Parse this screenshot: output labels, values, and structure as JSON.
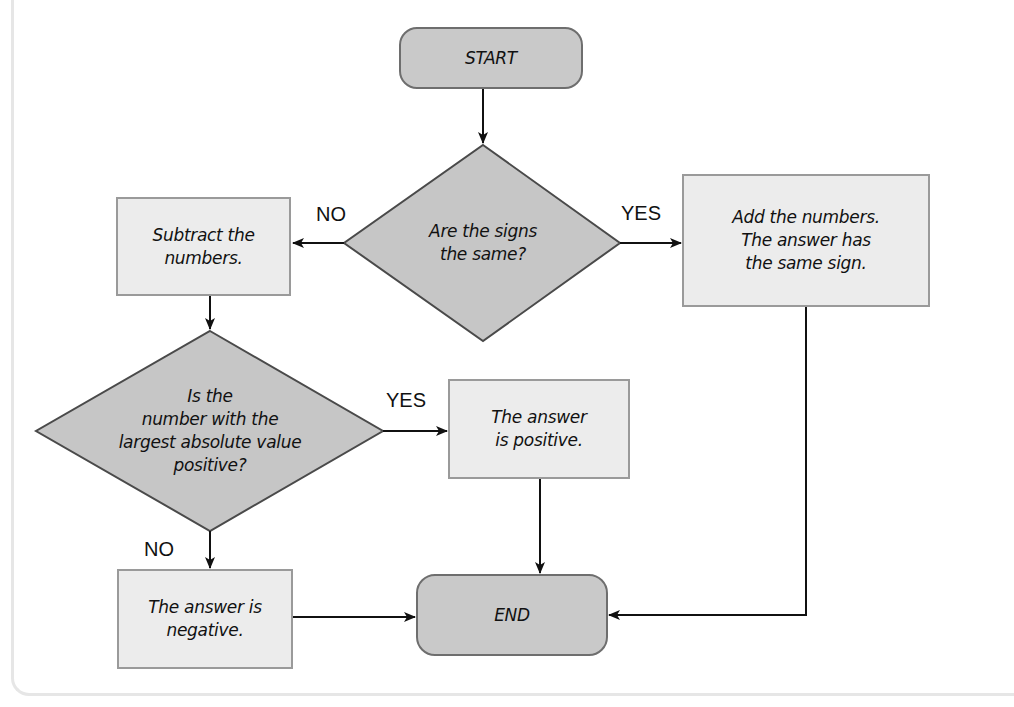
{
  "colors": {
    "box_fill": "#ececec",
    "box_border": "#9a9a9a",
    "terminal_fill": "#c9c9c9",
    "terminal_border": "#6e6e6e",
    "diamond_fill": "#c6c6c6",
    "diamond_border": "#4a4a4a",
    "arrow": "#111111"
  },
  "nodes": {
    "start": {
      "text": "START"
    },
    "signs_same": {
      "text": "Are the signs\nthe same?"
    },
    "subtract": {
      "text": "Subtract the\nnumbers."
    },
    "add": {
      "text": "Add the numbers.\nThe answer has\nthe same sign."
    },
    "largest_positive": {
      "text": "Is the\nnumber with the\nlargest absolute value\npositive?"
    },
    "answer_positive": {
      "text": "The answer\nis positive."
    },
    "answer_negative": {
      "text": "The answer is\nnegative."
    },
    "end": {
      "text": "END"
    }
  },
  "edge_labels": {
    "signs_no": "NO",
    "signs_yes": "YES",
    "largest_yes": "YES",
    "largest_no": "NO"
  }
}
